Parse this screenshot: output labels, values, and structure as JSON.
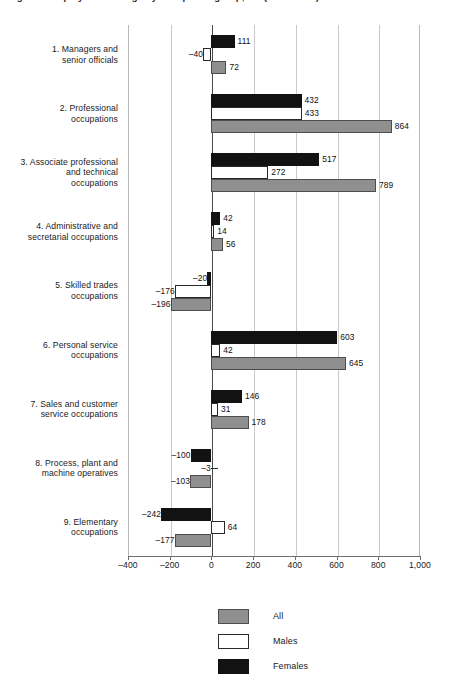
{
  "title": "Figure 1  Employment change by occupation group, UK (thousands)",
  "chart_data": {
    "type": "bar",
    "orientation": "horizontal",
    "title": "Figure 1  Employment change by occupation group, UK (thousands)",
    "xlabel": "",
    "ylabel": "",
    "xlim": [
      -400,
      1000
    ],
    "xticks": [
      -400,
      -200,
      0,
      200,
      400,
      600,
      800,
      1000
    ],
    "xtick_labels": [
      "–400",
      "–200",
      "0",
      "200",
      "400",
      "600",
      "800",
      "1,000"
    ],
    "grid": true,
    "legend_position": "bottom-center",
    "categories": [
      "1. Managers and senior officials",
      "2. Professional occupations",
      "3. Associate professional and technical occupations",
      "4. Administrative and secretarial occupations",
      "5. Skilled trades occupations",
      "6. Personal service occupations",
      "7. Sales and customer service occupations",
      "8. Process, plant and machine operatives",
      "9. Elementary occupations"
    ],
    "series": [
      {
        "name": "Females",
        "color": "#121212",
        "values": [
          111,
          432,
          517,
          42,
          -20,
          603,
          146,
          -100,
          -242
        ],
        "labels": [
          "111",
          "432",
          "517",
          "42",
          "–20",
          "603",
          "146",
          "–100",
          "–242"
        ]
      },
      {
        "name": "Males",
        "color": "#ffffff",
        "values": [
          -40,
          433,
          272,
          14,
          -176,
          42,
          31,
          -3,
          64
        ],
        "labels": [
          "–40",
          "433",
          "272",
          "14",
          "–176",
          "42",
          "31",
          "–3",
          "64"
        ]
      },
      {
        "name": "All",
        "color": "#8f8f8f",
        "values": [
          72,
          864,
          789,
          56,
          -196,
          645,
          178,
          -103,
          -177
        ],
        "labels": [
          "72",
          "864",
          "789",
          "56",
          "–196",
          "645",
          "178",
          "–103",
          "–177"
        ]
      }
    ]
  },
  "categories": [
    {
      "id": "managers",
      "lines": [
        "1. Managers and",
        "senior officials"
      ]
    },
    {
      "id": "professional",
      "lines": [
        "2. Professional",
        "occupations"
      ]
    },
    {
      "id": "associate-professional",
      "lines": [
        "3. Associate professional",
        "and technical",
        "occupations"
      ]
    },
    {
      "id": "administrative",
      "lines": [
        "4. Administrative and",
        "secretarial occupations"
      ]
    },
    {
      "id": "skilled-trades",
      "lines": [
        "5. Skilled trades",
        "occupations"
      ]
    },
    {
      "id": "personal-service",
      "lines": [
        "6. Personal service",
        "occupations"
      ]
    },
    {
      "id": "sales-customer-service",
      "lines": [
        "7. Sales and customer",
        "service occupations"
      ]
    },
    {
      "id": "process-plant-machine",
      "lines": [
        "8. Process, plant and",
        "machine operatives"
      ]
    },
    {
      "id": "elementary",
      "lines": [
        "9. Elementary",
        "occupations"
      ]
    }
  ],
  "legend": [
    {
      "label": "All",
      "swatch": "all"
    },
    {
      "label": "Males",
      "swatch": "males"
    },
    {
      "label": "Females",
      "swatch": "females"
    }
  ],
  "colors": {
    "all": "#8f8f8f",
    "males": "#ffffff",
    "females": "#121212",
    "gridline": "#c9c9c9",
    "axis": "#6d6d6d"
  }
}
